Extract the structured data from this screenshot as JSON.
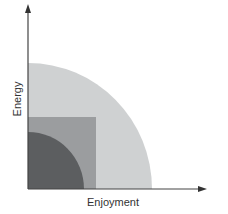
{
  "diagram": {
    "axes": {
      "x_label": "Enjoyment",
      "y_label": "Energy"
    },
    "regions": [
      {
        "name": "outer-quarter-circle",
        "shape": "quarter-circle",
        "color": "#cfd1d2"
      },
      {
        "name": "middle-square",
        "shape": "square",
        "color": "#9b9d9f"
      },
      {
        "name": "inner-quarter-circle",
        "shape": "quarter-circle",
        "color": "#5c5e60"
      }
    ],
    "axis_color": "#444444"
  }
}
